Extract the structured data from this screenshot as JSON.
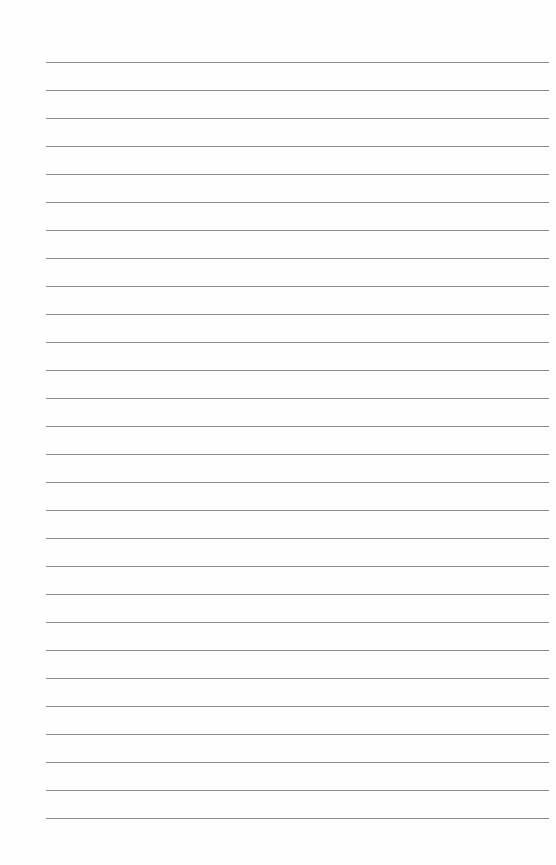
{
  "page": {
    "type": "lined-paper",
    "background": "#fefefe",
    "line_color": "#8a8a8a",
    "line_count": 28,
    "first_line_y": 62,
    "line_spacing": 28,
    "line_left": 46,
    "line_right": 549
  }
}
